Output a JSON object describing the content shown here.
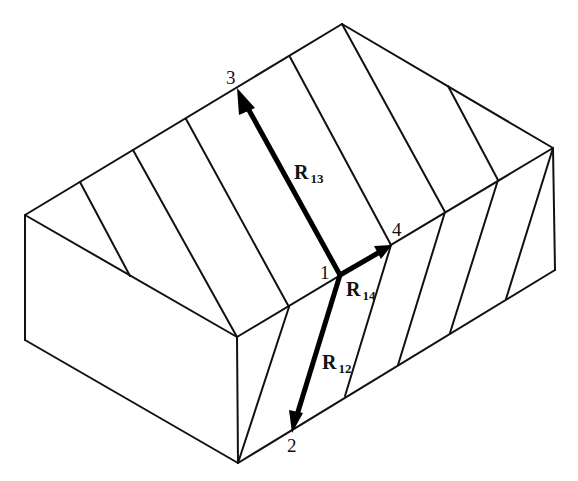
{
  "diagram": {
    "colors": {
      "line": "#111111",
      "vector": "#000000",
      "background": "#ffffff"
    },
    "points": [
      {
        "id": "1",
        "label": "1",
        "x": 340,
        "y": 275
      },
      {
        "id": "2",
        "label": "2",
        "x": 293,
        "y": 432
      },
      {
        "id": "3",
        "label": "3",
        "x": 237,
        "y": 90
      },
      {
        "id": "4",
        "label": "4",
        "x": 391,
        "y": 245
      }
    ],
    "vectors": [
      {
        "name": "R13",
        "label_main": "R",
        "label_sub": "13",
        "from": "1",
        "to": "3"
      },
      {
        "name": "R14",
        "label_main": "R",
        "label_sub": "14",
        "from": "1",
        "to": "4"
      },
      {
        "name": "R12",
        "label_main": "R",
        "label_sub": "12",
        "from": "1",
        "to": "2"
      }
    ]
  }
}
